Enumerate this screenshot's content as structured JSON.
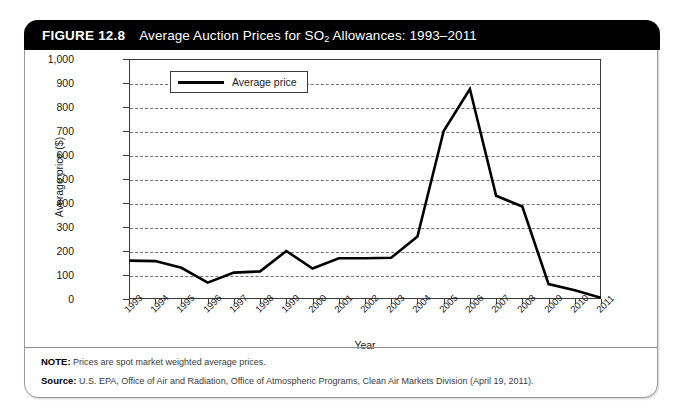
{
  "figure": {
    "number": "FIGURE 12.8",
    "title_prefix": "Average Auction Prices for SO",
    "title_sub": "2",
    "title_suffix": " Allowances: 1993–2011"
  },
  "legend": {
    "entries": [
      "Average price"
    ]
  },
  "notes": {
    "note_key": "NOTE:",
    "note_value": "Prices are spot market weighted average prices.",
    "source_key": "Source:",
    "source_value": "U.S. EPA, Office of Air and Radiation, Office of Atmospheric Programs, Clean Air Markets Division (April 19, 2011)."
  },
  "colors": {
    "title_bar": "#000000",
    "series_line": "#000000",
    "gridline": "#6f6f6f",
    "axis": "#3b3b3b",
    "card_border": "#9a9a9a"
  },
  "chart_data": {
    "type": "line",
    "title": "Average Auction Prices for SO2 Allowances: 1993–2011",
    "xlabel": "Year",
    "ylabel": "Average price ($)",
    "ylim": [
      0,
      1000
    ],
    "ytick_values": [
      0,
      100,
      200,
      300,
      400,
      500,
      600,
      700,
      800,
      900,
      1000
    ],
    "ytick_labels": [
      "0",
      "100",
      "200",
      "300",
      "400",
      "500",
      "600",
      "700",
      "800",
      "900",
      "1,000"
    ],
    "grid": true,
    "grid_style": "dashed-horizontal",
    "legend_position": "top-left-inside",
    "categories": [
      "1993",
      "1994",
      "1995",
      "1996",
      "1997",
      "1998",
      "1999",
      "2000",
      "2001",
      "2002",
      "2003",
      "2004",
      "2005",
      "2006",
      "2007",
      "2008",
      "2009",
      "2010",
      "2011"
    ],
    "series": [
      {
        "name": "Average price",
        "values": [
          160,
          158,
          130,
          68,
          110,
          115,
          200,
          127,
          170,
          170,
          172,
          260,
          700,
          875,
          430,
          385,
          62,
          36,
          5
        ]
      }
    ]
  }
}
